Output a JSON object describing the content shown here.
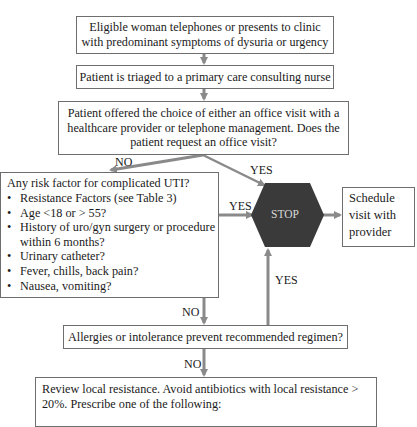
{
  "boxes": {
    "start": "Eligible woman telephones or presents to clinic with predominant symptoms of dysuria or urgency",
    "start_line1": "Eligible woman telephones or presents to clinic",
    "start_line2": "with predominant symptoms of dysuria or urgency",
    "triage": "Patient is triaged to a primary care consulting nurse",
    "choice_line1": "Patient offered the choice of either an office visit with a",
    "choice_line2": "healthcare provider or telephone management. Does the",
    "choice_line3": "patient request an office visit?",
    "risk": {
      "title": "Any risk factor for complicated UTI?",
      "items": [
        "Resistance Factors (see Table 3)",
        "Age <18 or > 55?",
        "History of uro/gyn surgery or procedure within 6 months?",
        "Urinary catheter?",
        "Fever, chills, back pain?",
        "Nausea, vomiting?"
      ]
    },
    "stop": "STOP",
    "schedule_line1": "Schedule",
    "schedule_line2": "visit with",
    "schedule_line3": "provider",
    "allergies": "Allergies or intolerance prevent recommended regimen?",
    "review_line1": "Review local resistance. Avoid antibiotics with local resistance >",
    "review_line2": "20%. Prescribe one of the following:"
  },
  "labels": {
    "no_choice": "NO",
    "yes_choice": "YES",
    "yes_risk": "YES",
    "yes_allergies": "YES",
    "no_risk": "NO",
    "no_allergies": "NO"
  },
  "colors": {
    "arrow": "#8a8a8a",
    "stop_fill": "#3a3a3a",
    "stop_text": "#d8d8d8",
    "border": "#6e6e6e"
  }
}
